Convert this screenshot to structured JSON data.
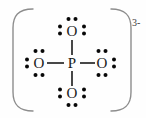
{
  "figure": {
    "kind": "lewis-dot-structure",
    "species_name": "phosphate ion",
    "formula": "PO4",
    "overall_charge_label": "3-",
    "background_color": "#fefefe",
    "ink_color": "#1a1a1a",
    "dot_color": "#080808",
    "bracket_color": "#8d8d8d"
  },
  "bracket": {
    "left_symbol": "(",
    "right_symbol": ")",
    "charge_superscript": "3-"
  },
  "atoms": {
    "center": {
      "symbol": "P",
      "name": "phosphorus",
      "x": 72,
      "y": 63,
      "lone_pairs": 0
    },
    "top": {
      "symbol": "O",
      "name": "oxygen-top",
      "x": 72,
      "y": 31,
      "lone_pairs": 3,
      "dot_sides": "top,left,right"
    },
    "left": {
      "symbol": "O",
      "name": "oxygen-left",
      "x": 39,
      "y": 63,
      "lone_pairs": 3,
      "dot_sides": "top,left,bottom"
    },
    "right": {
      "symbol": "O",
      "name": "oxygen-right",
      "x": 102,
      "y": 63,
      "lone_pairs": 3,
      "dot_sides": "top,right,bottom"
    },
    "bottom": {
      "symbol": "O",
      "name": "oxygen-bottom",
      "x": 72,
      "y": 93,
      "lone_pairs": 3,
      "dot_sides": "left,right,bottom"
    }
  },
  "bonds": [
    {
      "name": "bond-p-o-top",
      "from": "P",
      "to": "O",
      "order": 1,
      "x1": 72,
      "y1": 40,
      "x2": 72,
      "y2": 55
    },
    {
      "name": "bond-p-o-bottom",
      "from": "P",
      "to": "O",
      "order": 1,
      "x1": 72,
      "y1": 71,
      "x2": 72,
      "y2": 85
    },
    {
      "name": "bond-p-o-left",
      "from": "P",
      "to": "O",
      "order": 1,
      "x1": 47,
      "y1": 63,
      "x2": 64,
      "y2": 63
    },
    {
      "name": "bond-p-o-right",
      "from": "P",
      "to": "O",
      "order": 1,
      "x1": 80,
      "y1": 63,
      "x2": 95,
      "y2": 63
    }
  ],
  "electron_dots": {
    "radius": 2.0,
    "pair_gap": 7,
    "offset_from_atom": 10,
    "groups": [
      {
        "name": "dots-top-o-above",
        "cx": 72,
        "cy": 19,
        "orientation": "horizontal"
      },
      {
        "name": "dots-top-o-left",
        "cx": 60,
        "cy": 30,
        "orientation": "vertical"
      },
      {
        "name": "dots-top-o-right",
        "cx": 84,
        "cy": 30,
        "orientation": "vertical"
      },
      {
        "name": "dots-left-o-above",
        "cx": 39,
        "cy": 51,
        "orientation": "horizontal"
      },
      {
        "name": "dots-left-o-left",
        "cx": 27,
        "cy": 63,
        "orientation": "vertical"
      },
      {
        "name": "dots-left-o-below",
        "cx": 39,
        "cy": 75,
        "orientation": "horizontal"
      },
      {
        "name": "dots-right-o-above",
        "cx": 102,
        "cy": 51,
        "orientation": "horizontal"
      },
      {
        "name": "dots-right-o-right",
        "cx": 114,
        "cy": 63,
        "orientation": "vertical"
      },
      {
        "name": "dots-right-o-below",
        "cx": 102,
        "cy": 75,
        "orientation": "horizontal"
      },
      {
        "name": "dots-bottom-o-left",
        "cx": 60,
        "cy": 93,
        "orientation": "vertical"
      },
      {
        "name": "dots-bottom-o-right",
        "cx": 84,
        "cy": 93,
        "orientation": "vertical"
      },
      {
        "name": "dots-bottom-o-below",
        "cx": 72,
        "cy": 105,
        "orientation": "horizontal"
      }
    ]
  }
}
